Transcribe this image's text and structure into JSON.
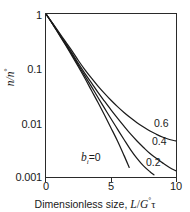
{
  "chart_data": {
    "type": "line",
    "title": "",
    "xlabel": "Dimensionless size, L/G°τ",
    "ylabel": "n/n°",
    "xlim": [
      0,
      10
    ],
    "ylim": [
      0.001,
      1
    ],
    "yscale": "log",
    "xscale": "linear",
    "grid": false,
    "legend_position": "inline-right",
    "xticks": [
      "0",
      "5",
      "10"
    ],
    "xtick_values": [
      0,
      5,
      10
    ],
    "yticks": [
      "1",
      "0.1",
      "0.01",
      "0.001"
    ],
    "ytick_values": [
      1,
      0.1,
      0.01,
      0.001
    ],
    "series": [
      {
        "name": "b = 0",
        "label": "b =0",
        "x": [
          0,
          0.5,
          1,
          1.5,
          2,
          2.5,
          3,
          3.5,
          4,
          4.5,
          5,
          5.5,
          6,
          6.4
        ],
        "values": [
          1,
          0.66,
          0.42,
          0.27,
          0.17,
          0.106,
          0.065,
          0.039,
          0.0235,
          0.0138,
          0.008,
          0.0046,
          0.0025,
          0.0015
        ]
      },
      {
        "name": "b = 0.2",
        "label": "0.2",
        "x": [
          0,
          0.5,
          1,
          1.5,
          2,
          2.5,
          3,
          3.5,
          4,
          4.5,
          5,
          5.5,
          6,
          6.5,
          7,
          7.5,
          8,
          8.3
        ],
        "values": [
          1,
          0.66,
          0.43,
          0.28,
          0.18,
          0.113,
          0.072,
          0.046,
          0.029,
          0.0185,
          0.0118,
          0.0076,
          0.0049,
          0.0032,
          0.0022,
          0.0016,
          0.00125,
          0.0011
        ]
      },
      {
        "name": "b = 0.4",
        "label": "0.4",
        "x": [
          0,
          0.5,
          1,
          1.5,
          2,
          2.5,
          3,
          3.5,
          4,
          4.5,
          5,
          5.5,
          6,
          6.5,
          7,
          7.5,
          8,
          8.5,
          9,
          9.5,
          10
        ],
        "values": [
          1,
          0.67,
          0.44,
          0.29,
          0.19,
          0.122,
          0.08,
          0.054,
          0.036,
          0.0248,
          0.0172,
          0.0121,
          0.0086,
          0.0062,
          0.0046,
          0.0035,
          0.0027,
          0.0022,
          0.0018,
          0.0015,
          0.0013
        ]
      },
      {
        "name": "b = 0.6",
        "label": "0.6",
        "x": [
          0,
          0.5,
          1,
          1.5,
          2,
          2.5,
          3,
          3.5,
          4,
          4.5,
          5,
          5.5,
          6,
          6.5,
          7,
          7.5,
          8,
          8.5,
          9,
          9.5,
          10
        ],
        "values": [
          1,
          0.68,
          0.46,
          0.31,
          0.21,
          0.138,
          0.094,
          0.066,
          0.047,
          0.0345,
          0.0258,
          0.0197,
          0.0154,
          0.0123,
          0.01,
          0.0083,
          0.007,
          0.0061,
          0.0054,
          0.0049,
          0.0046
        ]
      }
    ],
    "annotations": [
      {
        "id": "b0",
        "text_var": "b",
        "text_sub": "i",
        "text_eq": "=0",
        "x_px": 81,
        "y_px": 153
      },
      {
        "id": "p02",
        "text": "0.2",
        "x_px": 146,
        "y_px": 158
      },
      {
        "id": "p04",
        "text": "0.4",
        "x_px": 152,
        "y_px": 137
      },
      {
        "id": "p06",
        "text": "0.6",
        "x_px": 154,
        "y_px": 119
      }
    ],
    "colors": {
      "line": "#1a1a1a",
      "axis": "#2a2a2a",
      "background": "#ffffff"
    }
  },
  "axis": {
    "y_label_main": "n/n",
    "y_label_sup": "°",
    "x_label_prefix": "Dimensionless size, ",
    "x_label_math_l": "L",
    "x_label_slash": "/",
    "x_label_math_g": "G",
    "x_label_sup": "°",
    "x_label_tau": "τ"
  }
}
